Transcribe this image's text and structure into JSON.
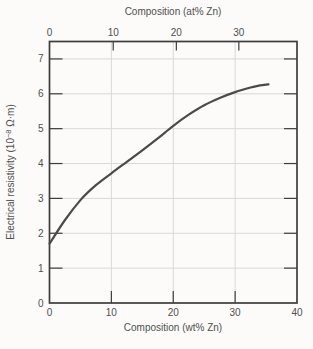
{
  "chart_data": {
    "type": "line",
    "title": "",
    "x_bottom": {
      "label": "Composition (wt% Zn)",
      "ticks": [
        0,
        10,
        20,
        30,
        40
      ],
      "range": [
        0,
        40
      ]
    },
    "x_top": {
      "label": "Composition (at% Zn)",
      "ticks": [
        {
          "label": "0",
          "x_wt": 0
        },
        {
          "label": "10",
          "x_wt": 10.3
        },
        {
          "label": "20",
          "x_wt": 20.5
        },
        {
          "label": "30",
          "x_wt": 30.6
        }
      ]
    },
    "y": {
      "label": "Electrical resistivity (10−8 Ω·m)",
      "label_parts": {
        "prefix": "Electrical resistivity (10",
        "sup": "−8",
        "suffix": " Ω·m)"
      },
      "ticks": [
        0,
        1,
        2,
        3,
        4,
        5,
        6,
        7
      ],
      "range": [
        0,
        7.5
      ]
    },
    "grid": {
      "visible": true,
      "x_lines": [
        10,
        20,
        30
      ],
      "y_lines": [
        1,
        2,
        3,
        4,
        5,
        6,
        7
      ]
    },
    "series": [
      {
        "points": [
          [
            0,
            1.7
          ],
          [
            2.5,
            2.38
          ],
          [
            5,
            2.95
          ],
          [
            7.5,
            3.38
          ],
          [
            10,
            3.72
          ],
          [
            12.5,
            4.05
          ],
          [
            15,
            4.38
          ],
          [
            17.5,
            4.72
          ],
          [
            20,
            5.08
          ],
          [
            22.5,
            5.4
          ],
          [
            25,
            5.67
          ],
          [
            27.5,
            5.88
          ],
          [
            30,
            6.05
          ],
          [
            32.5,
            6.18
          ],
          [
            34,
            6.24
          ],
          [
            35.4,
            6.27
          ]
        ]
      }
    ],
    "legend": null,
    "colors": {
      "curve": "#4a4a4a",
      "axis": "#3d3d3d",
      "grid": "#d8d8d6",
      "text": "#4f4f4f",
      "background": "#fcfbf9"
    }
  }
}
